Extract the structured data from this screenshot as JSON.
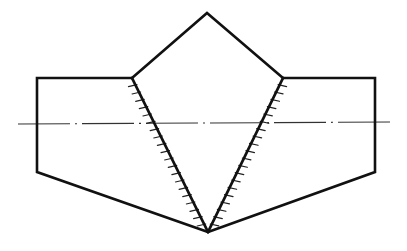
{
  "diagram": {
    "kind": "double-V weld joint cross-section (technical drawing)",
    "colors": {
      "stroke": "#111111",
      "background": "#ffffff"
    },
    "shapes": {
      "left_plate": [
        [
          132,
          78
        ],
        [
          37,
          78
        ],
        [
          37,
          172
        ],
        [
          208,
          232
        ]
      ],
      "right_plate": [
        [
          283,
          78
        ],
        [
          375,
          78
        ],
        [
          375,
          172
        ],
        [
          208,
          232
        ]
      ],
      "top_cap": [
        [
          132,
          78
        ],
        [
          207,
          13
        ],
        [
          283,
          78
        ]
      ],
      "left_weld_edge": [
        [
          132,
          78
        ],
        [
          208,
          232
        ]
      ],
      "right_weld_edge": [
        [
          283,
          78
        ],
        [
          208,
          232
        ]
      ]
    },
    "centerline": {
      "from": [
        18,
        124
      ],
      "to": [
        394,
        122
      ],
      "style": "dash-dot"
    },
    "tick_marks": {
      "count_per_edge": 20,
      "length": 7
    },
    "labels": []
  }
}
